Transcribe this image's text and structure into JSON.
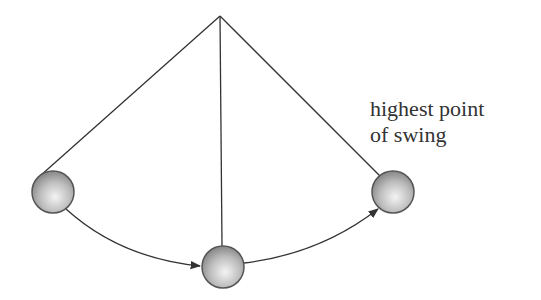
{
  "diagram": {
    "pivot": {
      "x": 220,
      "y": 16
    },
    "bobs": [
      {
        "name": "left-bob",
        "x": 53,
        "y": 192,
        "r": 21
      },
      {
        "name": "bottom-bob",
        "x": 223,
        "y": 267,
        "r": 21
      },
      {
        "name": "right-bob",
        "x": 393,
        "y": 192,
        "r": 21
      }
    ],
    "label": {
      "line1": "highest point",
      "line2": "of swing"
    },
    "colors": {
      "line": "#333333",
      "bob_light": "#f2f2f2",
      "bob_dark": "#8a8a8a",
      "bob_stroke": "#555555"
    }
  }
}
